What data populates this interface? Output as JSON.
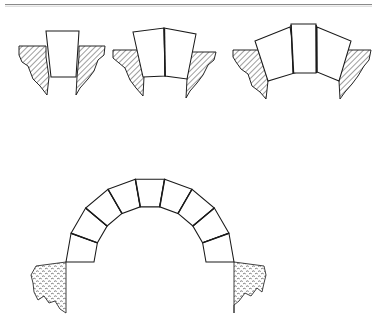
{
  "document": {
    "title": "Arch Construction Diagram",
    "description": "Technical line drawing showing progressive stages of voussoir arch assembly",
    "background_color": "#ffffff",
    "line_color": "#1a1a1a",
    "rule_color": "#8a8a8a"
  },
  "header_rule": {
    "name": "top-horizontal-rule",
    "x1": 5,
    "y1": 4.5,
    "x2": 372,
    "y2": 4.5,
    "color": "#8a8a8a"
  },
  "figures": [
    {
      "id": "stage-1",
      "name": "single-voussoir-stage",
      "voussoir_count": 1,
      "caption": "",
      "voussoirs": [
        {
          "name": "voussoir-center",
          "points": "46,31 79,31 76,77 51,77"
        }
      ],
      "joints": [],
      "abutments": [
        {
          "name": "abutment-left",
          "side": "left",
          "points": "19,46 46,46 46,57 49,77 47,95 40,86 33,79 28,66 22,62 19,55"
        },
        {
          "name": "abutment-right",
          "side": "right",
          "points": "79,46 105,46 104,55 98,60 94,71 88,79 80,88 76,95 77,77 79,57"
        }
      ]
    },
    {
      "id": "stage-2",
      "name": "two-voussoir-stage",
      "voussoir_count": 2,
      "caption": "",
      "voussoirs": [
        {
          "name": "voussoir-left",
          "points": "133,32 164,28 165,76 143,77"
        },
        {
          "name": "voussoir-right",
          "points": "164,28 196,34 187,79 165,76"
        }
      ],
      "joints": [
        {
          "name": "joint-center",
          "x1": 164.4,
          "y1": 28.5,
          "x2": 165.2,
          "y2": 76.5
        }
      ],
      "abutments": [
        {
          "name": "abutment-left",
          "side": "left",
          "points": "113,50 139,50 141,62 144,77 143,96 136,88 130,80 125,68 119,63 113,58"
        },
        {
          "name": "abutment-right",
          "side": "right",
          "points": "190,52 216,52 214,60 208,65 203,75 197,83 190,91 186,98 187,79 189,62"
        }
      ]
    },
    {
      "id": "stage-3",
      "name": "three-voussoir-stage",
      "voussoir_count": 3,
      "caption": "",
      "voussoirs": [
        {
          "name": "voussoir-left",
          "points": "255,41 290,27 298,72 268,81"
        },
        {
          "name": "voussoir-center",
          "points": "291,24 316,24 316,73 293,73"
        },
        {
          "name": "voussoir-right",
          "points": "317,27 351,41 339,81 317,72"
        }
      ],
      "joints": [
        {
          "name": "joint-left",
          "x1": 291.0,
          "y1": 25.0,
          "x2": 293.5,
          "y2": 73.0
        },
        {
          "name": "joint-right",
          "x1": 316.2,
          "y1": 25.0,
          "x2": 316.8,
          "y2": 73.0
        }
      ],
      "abutments": [
        {
          "name": "abutment-left",
          "side": "left",
          "points": "233,50 264,50 266,62 268,81 266,99 260,92 252,86 248,74 241,69 236,62 233,57"
        },
        {
          "name": "abutment-right",
          "side": "right",
          "points": "341,50 371,50 369,60 364,66 358,76 352,84 345,92 340,99 339,81 341,62"
        }
      ]
    }
  ],
  "main_arch": {
    "id": "full-arch",
    "name": "complete-semicircular-arch",
    "voussoir_count": 9,
    "center_x": 150,
    "center_y": 262,
    "inner_radius": 56,
    "outer_radius": 84,
    "start_angle_deg": 180,
    "end_angle_deg": 0,
    "voussoirs": [
      {
        "name": "voussoir-1",
        "index": 1
      },
      {
        "name": "voussoir-2",
        "index": 2
      },
      {
        "name": "voussoir-3",
        "index": 3
      },
      {
        "name": "voussoir-4",
        "index": 4
      },
      {
        "name": "voussoir-5-keystone",
        "index": 5
      },
      {
        "name": "voussoir-6",
        "index": 6
      },
      {
        "name": "voussoir-7",
        "index": 7
      },
      {
        "name": "voussoir-8",
        "index": 8
      },
      {
        "name": "voussoir-9",
        "index": 9
      }
    ],
    "abutments": [
      {
        "name": "abutment-left",
        "side": "left",
        "texture": "stipple",
        "points": "36,266 66,262 66,313 60,309 55,301 49,303 44,296 38,300 34,292 33,283 31,275"
      },
      {
        "name": "abutment-right",
        "side": "right",
        "texture": "stipple",
        "points": "234,262 264,266 266,275 264,283 262,292 257,288 251,296 245,293 239,301 234,305 234,313"
      }
    ]
  }
}
